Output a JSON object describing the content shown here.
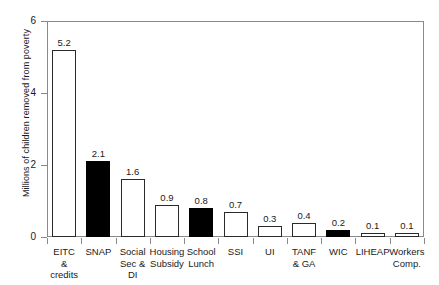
{
  "chart_data": {
    "type": "bar",
    "title": "",
    "xlabel": "",
    "ylabel": "Millions of children removed from poverty",
    "ylim": [
      0,
      6
    ],
    "yticks": [
      0,
      2,
      4,
      6
    ],
    "ytick_labels": [
      "0",
      "2",
      "4",
      "6"
    ],
    "grid": false,
    "legend": null,
    "categories": [
      "EITC & credits",
      "SNAP",
      "Social Sec & DI",
      "Housing Subsidy",
      "School Lunch",
      "SSI",
      "UI",
      "TANF & GA",
      "WIC",
      "LIHEAP",
      "Workers Comp."
    ],
    "category_label_lines": [
      [
        "EITC",
        "&",
        "credits"
      ],
      [
        "SNAP"
      ],
      [
        "Social",
        "Sec &",
        "DI"
      ],
      [
        "Housing",
        "Subsidy"
      ],
      [
        "School",
        "Lunch"
      ],
      [
        "SSI"
      ],
      [
        "UI"
      ],
      [
        "TANF",
        "& GA"
      ],
      [
        "WIC"
      ],
      [
        "LIHEAP"
      ],
      [
        "Workers",
        "Comp."
      ]
    ],
    "values": [
      5.2,
      2.1,
      1.6,
      0.9,
      0.8,
      0.7,
      0.3,
      0.4,
      0.2,
      0.1,
      0.1
    ],
    "value_labels": [
      "5.2",
      "2.1",
      "1.6",
      "0.9",
      "0.8",
      "0.7",
      "0.3",
      "0.4",
      "0.2",
      "0.1",
      "0.1"
    ],
    "bar_fills": [
      "open",
      "filled",
      "open",
      "open",
      "filled",
      "open",
      "open",
      "open",
      "filled",
      "open",
      "open"
    ],
    "colors": {
      "bar_open_fill": "#ffffff",
      "bar_filled_fill": "#000000",
      "bar_outline": "#2a2a2a",
      "axis": "#8a8a8a",
      "text": "#1a1a1a",
      "background": "#ffffff"
    }
  }
}
